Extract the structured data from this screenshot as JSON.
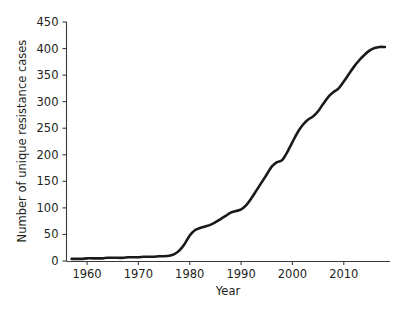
{
  "chart_data": {
    "type": "line",
    "title": "",
    "subtitle": "",
    "xlabel": "Year",
    "ylabel": "Number of unique resistance cases",
    "xlim": [
      1956,
      2019
    ],
    "ylim": [
      0,
      450
    ],
    "grid": false,
    "legend": null,
    "legend_position": "none",
    "x_ticks": [
      1960,
      1970,
      1980,
      1990,
      2000,
      2010
    ],
    "x_tick_labels": [
      "1960",
      "1970",
      "1980",
      "1990",
      "2000",
      "2010"
    ],
    "y_ticks": [
      0,
      50,
      100,
      150,
      200,
      250,
      300,
      350,
      400,
      450
    ],
    "y_tick_labels": [
      "0",
      "50",
      "100",
      "150",
      "200",
      "250",
      "300",
      "350",
      "400",
      "450"
    ],
    "series": [
      {
        "name": "Unique resistance cases",
        "color": "#1a1a1a",
        "x": [
          1957,
          1958,
          1959,
          1960,
          1961,
          1962,
          1963,
          1964,
          1965,
          1966,
          1967,
          1968,
          1969,
          1970,
          1971,
          1972,
          1973,
          1974,
          1975,
          1976,
          1977,
          1978,
          1979,
          1980,
          1981,
          1982,
          1983,
          1984,
          1985,
          1986,
          1987,
          1988,
          1989,
          1990,
          1991,
          1992,
          1993,
          1994,
          1995,
          1996,
          1997,
          1998,
          1999,
          2000,
          2001,
          2002,
          2003,
          2004,
          2005,
          2006,
          2007,
          2008,
          2009,
          2010,
          2011,
          2012,
          2013,
          2014,
          2015,
          2016,
          2017,
          2018
        ],
        "y": [
          4,
          4,
          4,
          5,
          5,
          5,
          5,
          6,
          6,
          6,
          6,
          7,
          7,
          7,
          8,
          8,
          8,
          9,
          9,
          10,
          13,
          20,
          32,
          48,
          58,
          62,
          65,
          68,
          73,
          79,
          85,
          91,
          94,
          97,
          105,
          118,
          133,
          148,
          163,
          178,
          186,
          190,
          205,
          224,
          242,
          256,
          266,
          272,
          282,
          296,
          309,
          318,
          325,
          338,
          352,
          366,
          378,
          388,
          396,
          401,
          403,
          403
        ]
      }
    ]
  },
  "axes": {
    "x_title": "Year",
    "y_title": "Number of unique resistance cases"
  }
}
